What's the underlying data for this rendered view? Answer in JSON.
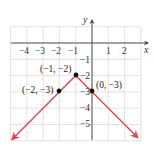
{
  "chart_data": {
    "type": "line",
    "title": "",
    "xlabel": "x",
    "ylabel": "y",
    "xlim": [
      -5,
      3
    ],
    "ylim": [
      -6,
      1
    ],
    "grid": true,
    "x_ticks": [
      "-4",
      "-3",
      "-2",
      "-1",
      "1",
      "2"
    ],
    "y_ticks": [
      "-1",
      "-2",
      "-3",
      "-4",
      "-5"
    ],
    "series": [
      {
        "name": "y = -|x + 1| - 2",
        "color": "#e0454f",
        "x": [
          -4.9,
          -1,
          2.8
        ],
        "y": [
          -5.9,
          -2,
          -5.8
        ],
        "arrows": "both"
      }
    ],
    "annotations": [
      {
        "x": -1,
        "y": -2,
        "label": "(-1, -2)"
      },
      {
        "x": -2,
        "y": -3,
        "label": "(-2, -3)"
      },
      {
        "x": 0,
        "y": -3,
        "label": "(0, -3)"
      }
    ]
  },
  "labels": {
    "x_axis": "x",
    "y_axis": "y",
    "x_ticks": [
      "−4",
      "−3",
      "−2",
      "−1",
      "1",
      "2"
    ],
    "y_ticks": [
      "−1",
      "−2",
      "−3",
      "−4",
      "−5"
    ],
    "points": [
      "(−1, −2)",
      "(−2, −3)",
      "(0, −3)"
    ]
  }
}
